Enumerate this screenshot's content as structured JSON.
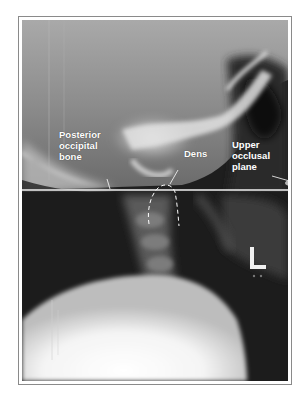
{
  "figure": {
    "annotations": {
      "posterior_occipital": [
        "Posterior",
        "occipital",
        "bone"
      ],
      "dens": "Dens",
      "upper_occlusal": [
        "Upper",
        "occlusal",
        "plane"
      ]
    },
    "side_marker": "L",
    "colors": {
      "frame_border": "#8a8a8a",
      "label_text": "#ffffff",
      "reference_line": "#f2f2f2"
    }
  }
}
